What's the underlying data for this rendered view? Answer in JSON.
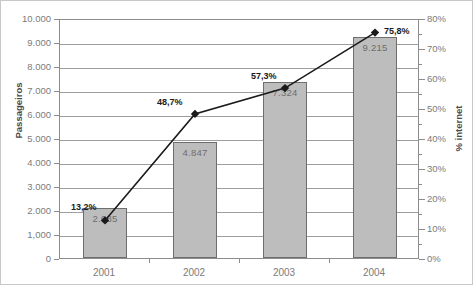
{
  "chart_data": {
    "type": "bar",
    "title": "",
    "categories": [
      "2001",
      "2002",
      "2003",
      "2004"
    ],
    "series": [
      {
        "name": "Passageiros",
        "type": "bar",
        "axis": "left",
        "values": [
          2085,
          4847,
          7324,
          9215
        ],
        "labels": [
          "2.085",
          "4.847",
          "7.324",
          "9.215"
        ]
      },
      {
        "name": "% internet",
        "type": "line",
        "axis": "right",
        "values": [
          13.2,
          48.7,
          57.3,
          75.8
        ],
        "labels": [
          "13,2%",
          "48,7%",
          "57,3%",
          "75,8%"
        ]
      }
    ],
    "xlabel": "",
    "ylabel": "Passageiros",
    "y2label": "% internet",
    "ylim": [
      0,
      10000
    ],
    "y2lim": [
      0,
      80
    ],
    "yticks": [
      0,
      1000,
      2000,
      3000,
      4000,
      5000,
      6000,
      7000,
      8000,
      9000,
      10000
    ],
    "ytick_labels": [
      "0",
      "1,000",
      "2.000",
      "3.000",
      "4.000",
      "5.000",
      "6.000",
      "7.000",
      "8.000",
      "9.000",
      "10.000"
    ],
    "y2ticks": [
      0,
      10,
      20,
      30,
      40,
      50,
      60,
      70,
      80
    ],
    "y2tick_labels": [
      "0%",
      "10%",
      "20%",
      "30%",
      "40%",
      "50%",
      "60%",
      "70%",
      "80%"
    ],
    "y2_minor_ticks": [
      5,
      15,
      25,
      35,
      45,
      55,
      65,
      75
    ],
    "grid": true,
    "legend": "none",
    "colors": {
      "bar_fill": "#bdbdbd",
      "bar_edge": "#6e6e6e",
      "line": "#1a1a1a",
      "marker": "#1a1a1a",
      "gridline": "#9e9e9e",
      "axis": "#8c8c8c",
      "tick_text": "#7b7b7b",
      "axis_title": "#4a4a4a"
    }
  }
}
